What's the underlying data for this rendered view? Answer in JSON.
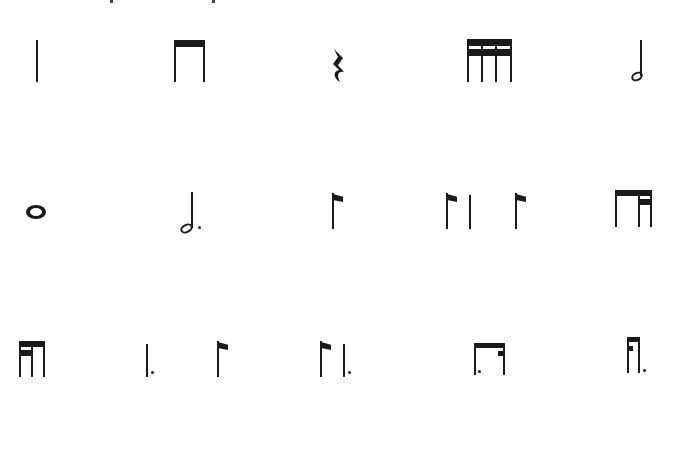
{
  "page": {
    "background": "#ffffff",
    "ink_color": "#1a1a1a"
  },
  "rows": [
    {
      "items": [
        {
          "id": "quarter-note",
          "label": "Quarter note (ta)"
        },
        {
          "id": "two-eighth-notes",
          "label": "Two beamed eighth notes (ti-ti)"
        },
        {
          "id": "quarter-rest",
          "label": "Quarter rest"
        },
        {
          "id": "four-sixteenth-notes",
          "label": "Four beamed sixteenth notes (tika-tika)"
        },
        {
          "id": "half-note",
          "label": "Half note (ta-a)"
        }
      ]
    },
    {
      "items": [
        {
          "id": "whole-note",
          "label": "Whole note (ta-a-a-a)"
        },
        {
          "id": "dotted-half-note",
          "label": "Dotted half note (ta-a-a)"
        },
        {
          "id": "single-eighth-note",
          "label": "Single eighth note"
        },
        {
          "id": "syncopation",
          "label": "Eighth - quarter - eighth (syncopa)"
        },
        {
          "id": "eighth-two-sixteenths",
          "label": "Eighth and two sixteenths (ti-tika)"
        }
      ]
    },
    {
      "items": [
        {
          "id": "two-sixteenths-eighth",
          "label": "Two sixteenths and eighth (tika-ti)"
        },
        {
          "id": "dotted-quarter-eighth",
          "label": "Dotted quarter and eighth"
        },
        {
          "id": "eighth-dotted-quarter",
          "label": "Eighth and dotted quarter"
        },
        {
          "id": "dotted-eighth-sixteenth",
          "label": "Dotted eighth and sixteenth (tim-ka)"
        },
        {
          "id": "sixteenth-dotted-eighth",
          "label": "Sixteenth and dotted eighth (ti-kam)"
        }
      ]
    }
  ]
}
